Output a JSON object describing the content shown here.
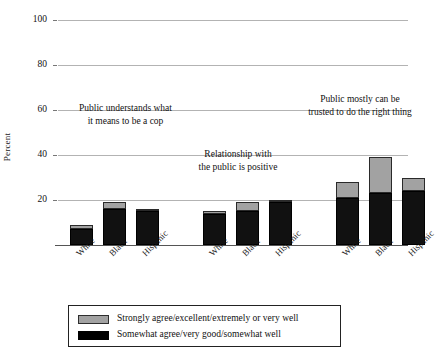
{
  "chart_data": {
    "type": "bar",
    "title": "",
    "subtitle": "",
    "xlabel": "",
    "ylabel": "Percent",
    "ylim": [
      0,
      100
    ],
    "yticks": [
      0,
      20,
      40,
      60,
      80,
      100
    ],
    "ytick_labels": [
      "0",
      "20",
      "40",
      "60",
      "80",
      "100"
    ],
    "grid": true,
    "stacked": true,
    "legend_position": "bottom",
    "categories": [
      "White",
      "Black",
      "Hispanic",
      "White",
      "Black",
      "Hispanic",
      "White",
      "Black",
      "Hispanic"
    ],
    "groups": [
      {
        "name": "Public understands what it means to be a cop",
        "categories": [
          "White",
          "Black",
          "Hispanic"
        ],
        "somewhat": [
          7,
          16,
          15
        ],
        "strongly": [
          2,
          3,
          1
        ],
        "totals": [
          9,
          19,
          16
        ]
      },
      {
        "name": "Relationship with the public is positive",
        "categories": [
          "White",
          "Black",
          "Hispanic"
        ],
        "somewhat": [
          14,
          15,
          19
        ],
        "strongly": [
          1,
          4,
          1
        ],
        "totals": [
          15,
          19,
          20
        ]
      },
      {
        "name": "Public mostly can be trusted to do the right thing",
        "categories": [
          "White",
          "Black",
          "Hispanic"
        ],
        "somewhat": [
          21,
          23,
          24
        ],
        "strongly": [
          7,
          16,
          6
        ],
        "totals": [
          28,
          39,
          30
        ]
      }
    ],
    "series": [
      {
        "name": "Somewhat agree/very good/somewhat well",
        "color": "#111111",
        "values": [
          7,
          16,
          15,
          14,
          15,
          19,
          21,
          23,
          24
        ]
      },
      {
        "name": "Strongly agree/excellent/extremely or very well",
        "color": "#a2a2a2",
        "values": [
          2,
          3,
          1,
          1,
          4,
          1,
          7,
          16,
          6
        ]
      }
    ],
    "annotations": [
      {
        "id": "annot-understands",
        "line1": "Public understands what",
        "line2": "it means to be a cop"
      },
      {
        "id": "annot-relationship",
        "line1": "Relationship with",
        "line2": "the public is positive"
      },
      {
        "id": "annot-trusted",
        "line1": "Public mostly can be",
        "line2": "trusted to do the right thing"
      }
    ]
  },
  "axis": {
    "ylabel": "Percent",
    "ticks": [
      "100",
      "80",
      "60",
      "40",
      "20"
    ]
  },
  "legend": {
    "items": [
      {
        "label": "Strongly agree/excellent/extremely or very well",
        "color": "#a2a2a2"
      },
      {
        "label": "Somewhat agree/very good/somewhat well",
        "color": "#000000"
      }
    ]
  },
  "xlabels": [
    "White",
    "Black",
    "Hispanic",
    "White",
    "Black",
    "Hispanic",
    "White",
    "Black",
    "Hispanic"
  ],
  "colors": {
    "dark": "#111111",
    "light": "#a2a2a2",
    "grid": "#b3b3b3",
    "axis": "#555555",
    "text": "#111111",
    "background": "#ffffff"
  }
}
